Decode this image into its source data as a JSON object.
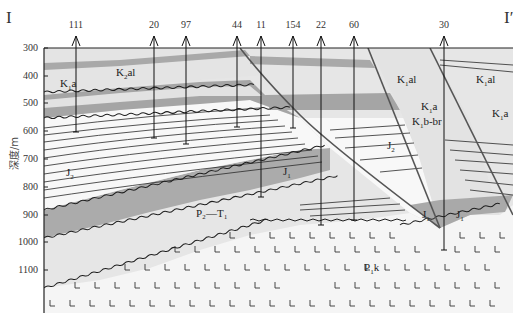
{
  "section": {
    "start_label": "I",
    "end_label": "I′"
  },
  "axis": {
    "ylabel": "深度/m",
    "ticks": [
      "300",
      "400",
      "500",
      "600",
      "700",
      "800",
      "900",
      "1000",
      "1100"
    ]
  },
  "wells": [
    {
      "id": "111",
      "x": 76,
      "bottom_depth": 650
    },
    {
      "id": "20",
      "x": 154,
      "bottom_depth": 670
    },
    {
      "id": "97",
      "x": 186,
      "bottom_depth": 690
    },
    {
      "id": "44",
      "x": 237,
      "bottom_depth": 590
    },
    {
      "id": "11",
      "x": 261,
      "bottom_depth": 830
    },
    {
      "id": "154",
      "x": 293,
      "bottom_depth": 590
    },
    {
      "id": "22",
      "x": 321,
      "bottom_depth": 930
    },
    {
      "id": "60",
      "x": 354,
      "bottom_depth": 920
    },
    {
      "id": "30",
      "x": 444,
      "bottom_depth": 1020
    }
  ],
  "strata_labels": {
    "k2al": {
      "main": "K",
      "sub": "2",
      "rest": "al"
    },
    "k1a_left": {
      "main": "K",
      "sub": "1",
      "rest": "a"
    },
    "j2_left": {
      "main": "J",
      "sub": "2",
      "rest": ""
    },
    "k1al_mid": {
      "main": "K",
      "sub": "1",
      "rest": "al"
    },
    "k1al_right": {
      "main": "K",
      "sub": "1",
      "rest": "al"
    },
    "k1a_mid": {
      "main": "K",
      "sub": "1",
      "rest": "a"
    },
    "k1a_right": {
      "main": "K",
      "sub": "1",
      "rest": "a"
    },
    "k1bbr": {
      "main": "K",
      "sub": "1",
      "rest": "b-br"
    },
    "j2_mid": {
      "main": "J",
      "sub": "2",
      "rest": ""
    },
    "j1_mid": {
      "main": "J",
      "sub": "1",
      "rest": ""
    },
    "p2t1": {
      "text": "P₂—T₁"
    },
    "j1_fault1": {
      "main": "J",
      "sub": "1",
      "rest": ""
    },
    "j1_fault2": {
      "main": "J",
      "sub": "1",
      "rest": ""
    },
    "p1k": {
      "main": "P",
      "sub": "1",
      "rest": "k"
    }
  },
  "colors": {
    "light_fill": "#e3e3e3",
    "dark_fill": "#a9a9a9",
    "white_fill": "#f7f7f7",
    "line": "#2a2a2a",
    "basalt_bg": "#f4f4f4"
  }
}
